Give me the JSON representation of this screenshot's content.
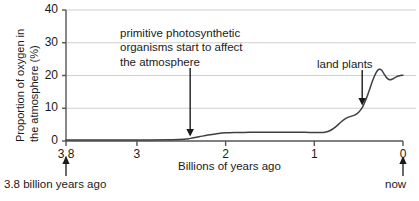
{
  "chart_data": {
    "type": "line",
    "title": "",
    "xlabel": "Billions of years ago",
    "ylabel_line1": "Proportion of oxygen in",
    "ylabel_line2": "the atmosphere (%)",
    "xlim": [
      3.8,
      0
    ],
    "ylim": [
      0,
      40
    ],
    "x_ticks": [
      "3.8",
      "3",
      "2",
      "1",
      "0"
    ],
    "x_tick_values": [
      3.8,
      3,
      2,
      1,
      0
    ],
    "y_ticks": [
      "0",
      "10",
      "20",
      "30",
      "40"
    ],
    "y_tick_values": [
      0,
      10,
      20,
      30,
      40
    ],
    "grid": "horizontal",
    "legend": "none",
    "line_color": "#3f3f3f",
    "axis_color": "#555555",
    "grid_color": "#cfcfcf",
    "series": [
      {
        "name": "Atmospheric oxygen",
        "x": [
          3.8,
          3.4,
          3.0,
          2.6,
          2.45,
          2.4,
          2.3,
          2.2,
          2.1,
          2.0,
          1.9,
          1.8,
          1.6,
          1.4,
          1.2,
          1.05,
          0.95,
          0.88,
          0.82,
          0.76,
          0.7,
          0.64,
          0.58,
          0.54,
          0.5,
          0.46,
          0.42,
          0.38,
          0.34,
          0.3,
          0.27,
          0.24,
          0.21,
          0.18,
          0.15,
          0.12,
          0.08,
          0.04,
          0.0
        ],
        "y": [
          0.3,
          0.3,
          0.3,
          0.4,
          0.6,
          0.8,
          1.3,
          1.8,
          2.2,
          2.5,
          2.6,
          2.6,
          2.7,
          2.7,
          2.7,
          2.6,
          2.6,
          2.7,
          3.2,
          4.3,
          5.8,
          7.0,
          7.6,
          8.0,
          8.8,
          10.2,
          12.5,
          15.5,
          18.6,
          21.0,
          21.9,
          21.6,
          20.3,
          19.2,
          18.7,
          18.9,
          19.5,
          19.9,
          20.1
        ]
      }
    ],
    "annotations": [
      {
        "name": "primitive-photosynthetic",
        "lines": [
          "primitive photosynthetic",
          "organisms start to affect",
          "the atmosphere"
        ],
        "arrow_x_value": 2.4,
        "arrow_points_to_y": 0.8
      },
      {
        "name": "land-plants",
        "lines": [
          "land plants"
        ],
        "arrow_x_value": 0.46,
        "arrow_points_to_y": 10.2
      }
    ],
    "captions": {
      "left": "3.8 billion years ago",
      "right": "now"
    }
  }
}
